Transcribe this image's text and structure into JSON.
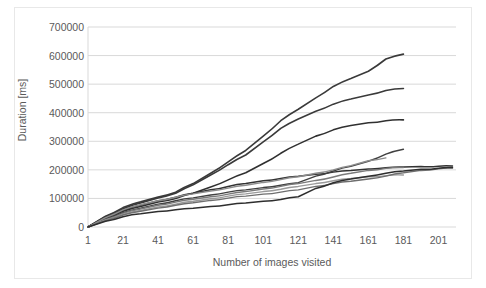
{
  "chart_data": {
    "type": "line",
    "title": "",
    "xlabel": "Number of images visited",
    "ylabel": "Duration [ms]",
    "xlim": [
      1,
      211
    ],
    "ylim": [
      0,
      700000
    ],
    "xticks": [
      1,
      21,
      41,
      61,
      81,
      101,
      121,
      141,
      161,
      181,
      201
    ],
    "yticks": [
      0,
      100000,
      200000,
      300000,
      400000,
      500000,
      600000,
      700000
    ],
    "grid": true,
    "legend": "none",
    "x_step": 10,
    "series": [
      {
        "name": "session-1",
        "color": "#3a3a3a",
        "width": 1.6,
        "x": [
          1,
          11,
          21,
          31,
          41,
          51,
          61,
          71,
          81,
          91,
          101,
          111,
          121,
          131,
          141,
          151,
          161,
          171,
          181
        ],
        "values": [
          0,
          38000,
          68000,
          88000,
          105000,
          122000,
          152000,
          188000,
          228000,
          268000,
          318000,
          372000,
          412000,
          452000,
          492000,
          520000,
          545000,
          588000,
          605000
        ]
      },
      {
        "name": "session-2",
        "color": "#3a3a3a",
        "width": 1.6,
        "x": [
          1,
          11,
          21,
          31,
          41,
          51,
          61,
          71,
          81,
          91,
          101,
          111,
          121,
          131,
          141,
          151,
          161,
          171,
          181
        ],
        "values": [
          0,
          36000,
          64000,
          84000,
          102000,
          118000,
          148000,
          182000,
          218000,
          252000,
          298000,
          345000,
          378000,
          405000,
          430000,
          448000,
          462000,
          478000,
          485000
        ]
      },
      {
        "name": "session-3",
        "color": "#303030",
        "width": 1.6,
        "x": [
          1,
          11,
          21,
          31,
          41,
          51,
          61,
          71,
          81,
          91,
          101,
          111,
          121,
          131,
          141,
          151,
          161,
          171,
          181
        ],
        "values": [
          0,
          30000,
          55000,
          72000,
          88000,
          100000,
          118000,
          140000,
          165000,
          190000,
          222000,
          258000,
          290000,
          318000,
          340000,
          355000,
          365000,
          372000,
          375000
        ]
      },
      {
        "name": "session-4",
        "color": "#333333",
        "width": 1.5,
        "x": [
          1,
          11,
          21,
          31,
          41,
          51,
          61,
          71,
          81,
          91,
          101,
          111,
          121,
          131,
          141,
          151,
          161,
          171,
          181,
          191,
          201,
          209
        ],
        "values": [
          0,
          32000,
          58000,
          76000,
          92000,
          104000,
          118000,
          130000,
          142000,
          152000,
          162000,
          170000,
          178000,
          185000,
          192000,
          198000,
          203000,
          207000,
          210000,
          212000,
          213000,
          213500
        ]
      },
      {
        "name": "session-5",
        "color": "#404040",
        "width": 1.4,
        "x": [
          1,
          11,
          21,
          31,
          41,
          51,
          61,
          71,
          81,
          91,
          101,
          111,
          121,
          131,
          141,
          151,
          161,
          171,
          181
        ],
        "values": [
          0,
          28000,
          50000,
          66000,
          80000,
          92000,
          102000,
          112000,
          122000,
          130000,
          138000,
          146000,
          155000,
          178000,
          196000,
          212000,
          230000,
          255000,
          272000
        ]
      },
      {
        "name": "session-6",
        "color": "#8c8c8c",
        "width": 1.4,
        "x": [
          1,
          11,
          21,
          31,
          41,
          51,
          61,
          71,
          81,
          91,
          101,
          111,
          121,
          131,
          141,
          151,
          161,
          171
        ],
        "values": [
          0,
          33000,
          60000,
          78000,
          92000,
          104000,
          116000,
          126000,
          136000,
          146000,
          156000,
          166000,
          176000,
          188000,
          200000,
          215000,
          232000,
          242000
        ]
      },
      {
        "name": "session-7",
        "color": "#7a7a7a",
        "width": 1.4,
        "x": [
          1,
          11,
          21,
          31,
          41,
          51,
          61,
          71,
          81,
          91,
          101,
          111,
          121,
          131,
          141,
          151,
          161,
          171,
          181
        ],
        "values": [
          0,
          26000,
          48000,
          63000,
          76000,
          87000,
          97000,
          106000,
          115000,
          124000,
          133000,
          142000,
          152000,
          163000,
          175000,
          188000,
          198000,
          205000,
          208000
        ]
      },
      {
        "name": "session-8",
        "color": "#9a9a9a",
        "width": 1.4,
        "x": [
          1,
          11,
          21,
          31,
          41,
          51,
          61,
          71,
          81,
          91,
          101,
          111,
          121,
          131,
          141,
          151,
          161,
          171,
          181
        ],
        "values": [
          0,
          24000,
          44000,
          58000,
          70000,
          80000,
          90000,
          99000,
          108000,
          116000,
          124000,
          132000,
          142000,
          152000,
          162000,
          170000,
          176000,
          180000,
          182000
        ]
      },
      {
        "name": "session-9",
        "color": "#6f6f6f",
        "width": 1.4,
        "x": [
          1,
          11,
          21,
          31,
          41,
          51,
          61,
          71,
          81,
          91,
          101,
          111,
          121,
          131,
          141,
          151,
          161,
          171,
          181,
          191,
          201,
          209
        ],
        "values": [
          0,
          22000,
          42000,
          55000,
          66000,
          76000,
          85000,
          93000,
          101000,
          108000,
          115000,
          122000,
          130000,
          142000,
          152000,
          160000,
          168000,
          178000,
          190000,
          198000,
          204000,
          206000
        ]
      },
      {
        "name": "session-10",
        "color": "#2e2e2e",
        "width": 1.5,
        "x": [
          1,
          11,
          21,
          31,
          41,
          51,
          61,
          71,
          81,
          91,
          101,
          111,
          121,
          131,
          141,
          151,
          161,
          171,
          181,
          191,
          201,
          209
        ],
        "values": [
          0,
          20000,
          36000,
          46000,
          54000,
          60000,
          66000,
          72000,
          78000,
          84000,
          90000,
          96000,
          106000,
          135000,
          155000,
          168000,
          178000,
          188000,
          196000,
          202000,
          206000,
          208000
        ]
      }
    ]
  },
  "axes": {
    "ylabel": "Duration [ms]",
    "xlabel": "Number of images visited",
    "ytick_labels": [
      "700000",
      "600000",
      "500000",
      "400000",
      "300000",
      "200000",
      "100000",
      "0"
    ],
    "xtick_labels": [
      "1",
      "21",
      "41",
      "61",
      "81",
      "101",
      "121",
      "141",
      "161",
      "181",
      "201"
    ]
  },
  "style": {
    "grid_color": "#d9d9d9",
    "frame_color": "#e8e8e8",
    "text_color": "#5a5a5a"
  }
}
